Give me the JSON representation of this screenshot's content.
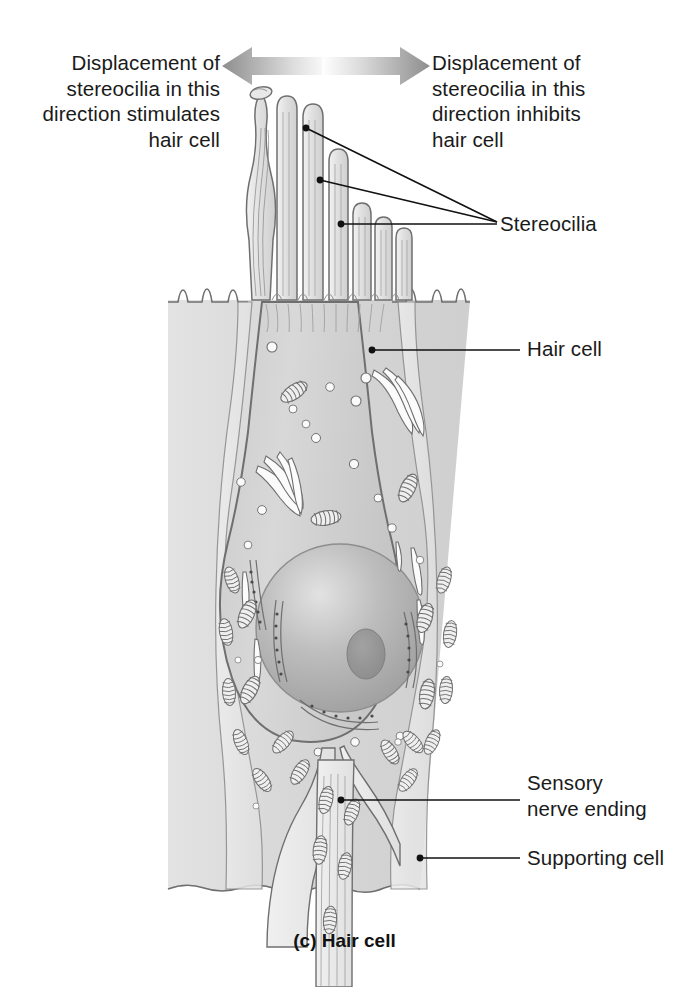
{
  "figure": {
    "caption": "(c) Hair cell",
    "caption_part": "(c)",
    "caption_title": "Hair cell",
    "background_color": "#ffffff",
    "ink_color": "#1a1a1a"
  },
  "annotations": {
    "left_note": "Displacement of\nstereocilia in this\ndirection stimulates\nhair cell",
    "right_note": "Displacement of\nstereocilia in this\ndirection inhibits\nhair cell",
    "arrow_name": "double-headed displacement arrow",
    "arrow_color": "#9a9a9a"
  },
  "labels": [
    {
      "id": "stereocilia",
      "text": "Stereocilia"
    },
    {
      "id": "hair-cell",
      "text": "Hair cell"
    },
    {
      "id": "sensory-nerve-ending",
      "text": "Sensory\nnerve ending"
    },
    {
      "id": "supporting-cell",
      "text": "Supporting cell"
    }
  ],
  "structures": {
    "stereocilia_count": 8,
    "kinocilium": "kinocilium",
    "organelles": [
      "mitochondria",
      "golgi-apparatus",
      "rough-endoplasmic-reticulum",
      "vesicles",
      "nucleus",
      "nucleolus"
    ],
    "cell_fill": "#d2d2d2",
    "supporting_fill": "#e6e6e6",
    "nucleus_fill": "#b0b0b0",
    "outline": "#6f6f6f"
  }
}
